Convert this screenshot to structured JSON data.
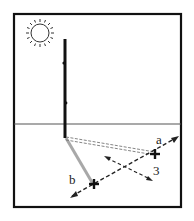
{
  "figure": {
    "labels": {
      "point_a": "a",
      "point_b": "b",
      "line_3": "3"
    },
    "icons": {
      "sun": "sun-icon",
      "cross_a": "cross-mark-icon",
      "cross_b": "cross-mark-icon"
    },
    "colors": {
      "frame": "#111111",
      "stick": "#111111",
      "shadow": "#a8a8a8",
      "dashed": "#222222",
      "ground_line": "#555555"
    }
  }
}
